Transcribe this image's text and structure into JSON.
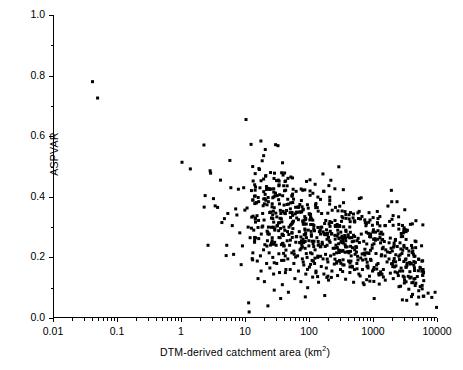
{
  "chart_data": {
    "type": "scatter",
    "title": "",
    "xlabel": "DTM-derived catchment area (km2)",
    "xlabel_base": "DTM-derived catchment area (km",
    "xlabel_sup": "2",
    "xlabel_tail": ")",
    "ylabel": "ASPVAR",
    "xscale": "log",
    "yscale": "linear",
    "xlim": [
      0.01,
      10000
    ],
    "ylim": [
      0.0,
      1.0
    ],
    "grid": false,
    "legend": null,
    "marker": "filled-square",
    "marker_color": "#000000",
    "marker_size_px": 3,
    "xtick_labels": [
      "0.01",
      "0.1",
      "1",
      "10",
      "100",
      "1000",
      "10000"
    ],
    "xtick_values": [
      0.01,
      0.1,
      1,
      10,
      100,
      1000,
      10000
    ],
    "ytick_labels": [
      "0.0",
      "0.2",
      "0.4",
      "0.6",
      "0.8",
      "1.0"
    ],
    "ytick_values": [
      0.0,
      0.2,
      0.4,
      0.6,
      0.8,
      1.0
    ],
    "minor_ticks_x": true,
    "minor_ticks_y": true,
    "n_points": 812,
    "points": [
      [
        0.04,
        0.78
      ],
      [
        0.048,
        0.726
      ],
      [
        1.0,
        0.514
      ],
      [
        1.35,
        0.492
      ],
      [
        2.2,
        0.571
      ],
      [
        2.22,
        0.366
      ],
      [
        2.3,
        0.404
      ],
      [
        2.55,
        0.24
      ],
      [
        2.75,
        0.486
      ],
      [
        2.8,
        0.478
      ],
      [
        3.1,
        0.394
      ],
      [
        3.3,
        0.37
      ],
      [
        3.6,
        0.365
      ],
      [
        4.0,
        0.455
      ],
      [
        4.2,
        0.315
      ],
      [
        4.6,
        0.328
      ],
      [
        4.9,
        0.206
      ],
      [
        5.0,
        0.24
      ],
      [
        5.2,
        0.345
      ],
      [
        5.6,
        0.52
      ],
      [
        5.8,
        0.43
      ],
      [
        6.1,
        0.305
      ],
      [
        6.4,
        0.21
      ],
      [
        6.9,
        0.36
      ],
      [
        7.2,
        0.34
      ],
      [
        7.6,
        0.425
      ],
      [
        8.0,
        0.281
      ],
      [
        8.4,
        0.176
      ],
      [
        8.8,
        0.238
      ],
      [
        9.2,
        0.43
      ],
      [
        9.6,
        0.356
      ],
      [
        10.0,
        0.655
      ],
      [
        10.4,
        0.363
      ],
      [
        10.8,
        0.3
      ],
      [
        11.0,
        0.05
      ],
      [
        11.2,
        0.02
      ],
      [
        11.6,
        0.265
      ],
      [
        12.0,
        0.573
      ],
      [
        12.5,
        0.196
      ],
      [
        12.8,
        0.215
      ],
      [
        13.2,
        0.29
      ],
      [
        13.6,
        0.25
      ],
      [
        14.0,
        0.33
      ],
      [
        14.5,
        0.38
      ],
      [
        15.0,
        0.188
      ],
      [
        15.4,
        0.13
      ],
      [
        15.8,
        0.262
      ],
      [
        16.2,
        0.49
      ],
      [
        16.8,
        0.205
      ],
      [
        17.2,
        0.155
      ],
      [
        17.8,
        0.3
      ],
      [
        18.2,
        0.345
      ],
      [
        18.8,
        0.225
      ],
      [
        19.4,
        0.12
      ],
      [
        20.0,
        0.556
      ],
      [
        20.4,
        0.47
      ],
      [
        21.0,
        0.18
      ],
      [
        21.6,
        0.255
      ],
      [
        22.0,
        0.04
      ],
      [
        22.4,
        0.3
      ],
      [
        23.0,
        0.215
      ],
      [
        23.6,
        0.165
      ],
      [
        24.2,
        0.48
      ],
      [
        25.0,
        0.33
      ],
      [
        25.6,
        0.255
      ],
      [
        26.2,
        0.2
      ],
      [
        27.0,
        0.145
      ],
      [
        27.6,
        0.092
      ],
      [
        28.2,
        0.29
      ],
      [
        29.0,
        0.572
      ],
      [
        29.6,
        0.24
      ],
      [
        30.2,
        0.18
      ],
      [
        31.0,
        0.305
      ],
      [
        32.0,
        0.455
      ],
      [
        32.6,
        0.212
      ],
      [
        33.4,
        0.15
      ],
      [
        34.2,
        0.265
      ],
      [
        35.0,
        0.345
      ],
      [
        36.0,
        0.19
      ],
      [
        37.0,
        0.11
      ],
      [
        38.0,
        0.245
      ],
      [
        39.0,
        0.3
      ],
      [
        40.0,
        0.42
      ],
      [
        41.0,
        0.205
      ],
      [
        42.0,
        0.16
      ],
      [
        43.0,
        0.355
      ],
      [
        44.0,
        0.255
      ],
      [
        45.0,
        0.195
      ],
      [
        46.0,
        0.085
      ],
      [
        47.0,
        0.3
      ],
      [
        48.0,
        0.24
      ],
      [
        49.0,
        0.16
      ],
      [
        50.0,
        0.38
      ],
      [
        52.0,
        0.215
      ],
      [
        54.0,
        0.295
      ],
      [
        56.0,
        0.18
      ],
      [
        58.0,
        0.13
      ],
      [
        60.0,
        0.25
      ],
      [
        62.0,
        0.33
      ],
      [
        64.0,
        0.205
      ],
      [
        66.0,
        0.155
      ],
      [
        68.0,
        0.285
      ],
      [
        70.0,
        0.225
      ],
      [
        72.0,
        0.12
      ],
      [
        74.0,
        0.35
      ],
      [
        76.0,
        0.195
      ],
      [
        78.0,
        0.26
      ],
      [
        80.0,
        0.175
      ],
      [
        82.0,
        0.31
      ],
      [
        84.0,
        0.23
      ],
      [
        86.0,
        0.145
      ],
      [
        88.0,
        0.265
      ],
      [
        90.0,
        0.2
      ],
      [
        92.0,
        0.1
      ],
      [
        94.0,
        0.29
      ],
      [
        96.0,
        0.238
      ],
      [
        98.0,
        0.168
      ],
      [
        100.0,
        0.456
      ],
      [
        102.0,
        0.215
      ],
      [
        105.0,
        0.275
      ],
      [
        108.0,
        0.19
      ],
      [
        110.0,
        0.135
      ],
      [
        112.0,
        0.245
      ],
      [
        115.0,
        0.305
      ],
      [
        118.0,
        0.18
      ],
      [
        120.0,
        0.225
      ],
      [
        124.0,
        0.155
      ],
      [
        128.0,
        0.265
      ],
      [
        132.0,
        0.2
      ],
      [
        136.0,
        0.118
      ],
      [
        140.0,
        0.285
      ],
      [
        145.0,
        0.235
      ],
      [
        150.0,
        0.17
      ],
      [
        155.0,
        0.25
      ],
      [
        160.0,
        0.195
      ],
      [
        165.0,
        0.145
      ],
      [
        170.0,
        0.275
      ],
      [
        175.0,
        0.21
      ],
      [
        180.0,
        0.165
      ],
      [
        185.0,
        0.24
      ],
      [
        190.0,
        0.185
      ],
      [
        195.0,
        0.125
      ],
      [
        200.0,
        0.255
      ],
      [
        210.0,
        0.205
      ],
      [
        220.0,
        0.155
      ],
      [
        230.0,
        0.23
      ],
      [
        240.0,
        0.178
      ],
      [
        250.0,
        0.365
      ],
      [
        260.0,
        0.215
      ],
      [
        270.0,
        0.14
      ],
      [
        280.0,
        0.245
      ],
      [
        290.0,
        0.19
      ],
      [
        300.0,
        0.16
      ],
      [
        320.0,
        0.22
      ],
      [
        340.0,
        0.175
      ],
      [
        360.0,
        0.128
      ],
      [
        380.0,
        0.235
      ],
      [
        400.0,
        0.188
      ],
      [
        420.0,
        0.15
      ],
      [
        440.0,
        0.205
      ],
      [
        460.0,
        0.168
      ],
      [
        480.0,
        0.118
      ],
      [
        500.0,
        0.225
      ],
      [
        540.0,
        0.18
      ],
      [
        580.0,
        0.145
      ],
      [
        620.0,
        0.198
      ],
      [
        660.0,
        0.16
      ],
      [
        700.0,
        0.11
      ],
      [
        750.0,
        0.215
      ],
      [
        800.0,
        0.172
      ],
      [
        850.0,
        0.138
      ],
      [
        900.0,
        0.19
      ],
      [
        950.0,
        0.155
      ],
      [
        1000.0,
        0.245
      ],
      [
        1100.0,
        0.175
      ],
      [
        1200.0,
        0.142
      ],
      [
        1300.0,
        0.205
      ],
      [
        1400.0,
        0.16
      ],
      [
        1500.0,
        0.125
      ],
      [
        1600.0,
        0.185
      ],
      [
        1800.0,
        0.148
      ],
      [
        2000.0,
        0.13
      ],
      [
        2200.0,
        0.172
      ],
      [
        2400.0,
        0.14
      ],
      [
        2600.0,
        0.105
      ],
      [
        2800.0,
        0.155
      ],
      [
        3000.0,
        0.125
      ],
      [
        3200.0,
        0.168
      ],
      [
        3500.0,
        0.095
      ],
      [
        3800.0,
        0.135
      ],
      [
        4000.0,
        0.078
      ],
      [
        4500.0,
        0.115
      ],
      [
        5000.0,
        0.09
      ],
      [
        6000.0,
        0.072
      ],
      [
        7000.0,
        0.082
      ],
      [
        8000.0,
        0.068
      ],
      [
        9000.0,
        0.085
      ],
      [
        9500.0,
        0.035
      ]
    ]
  }
}
